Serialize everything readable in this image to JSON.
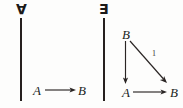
{
  "figure": {
    "kind": "commutative-diagram-pair",
    "panels": [
      {
        "id": "universal",
        "quantifier": "∀",
        "quantifier_name": "for-all",
        "objects": [
          {
            "id": "A",
            "label": "A"
          },
          {
            "id": "B",
            "label": "B"
          }
        ],
        "arrows": [
          {
            "from": "A",
            "to": "B",
            "label": "",
            "style": "horizontal"
          }
        ]
      },
      {
        "id": "existential",
        "quantifier": "∃",
        "quantifier_name": "there-exists",
        "objects": [
          {
            "id": "B_top",
            "label": "B"
          },
          {
            "id": "A",
            "label": "A"
          },
          {
            "id": "B_bot",
            "label": "B"
          }
        ],
        "arrows": [
          {
            "from": "B_top",
            "to": "A",
            "label": "",
            "style": "vertical"
          },
          {
            "from": "B_top",
            "to": "B_bot",
            "label": "1",
            "style": "diagonal"
          },
          {
            "from": "A",
            "to": "B_bot",
            "label": "",
            "style": "horizontal"
          }
        ]
      }
    ],
    "separators": [
      {
        "id": "rule-left",
        "orientation": "vertical"
      },
      {
        "id": "rule-right",
        "orientation": "vertical"
      }
    ],
    "colors": {
      "ink": "#231f1e",
      "paper": "#fdfdfc"
    }
  }
}
